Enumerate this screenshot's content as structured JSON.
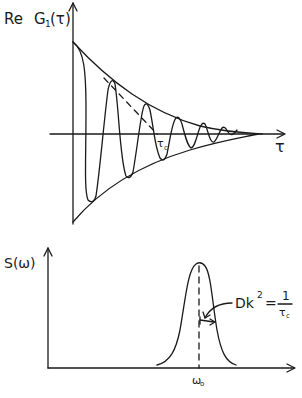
{
  "top_plot": {
    "y_label_re": "Re",
    "y_label_g": "G",
    "y_label_sub": "1",
    "y_label_arg": "(τ)",
    "x_label": "τ",
    "tau_c_label": "τ",
    "tau_c_sub": "c",
    "description": "Damped oscillation of Re G1(τ) bounded by exponentially decaying envelope; dashed tangent to envelope crosses τ-axis at τc"
  },
  "bottom_plot": {
    "y_label": "S(ω)",
    "x_label": "ω",
    "x_label_sub": "o",
    "annotation_lhs": "Dk",
    "annotation_exp": "2",
    "annotation_eq": "=",
    "annotation_num": "1",
    "annotation_den": "τ",
    "annotation_den_sub": "c",
    "description": "Spectral density S(ω) with a single peak centered at ω0; half-width Dk² = 1/τc"
  },
  "colors": {
    "ink": "#1a1a1a",
    "background": "#ffffff"
  }
}
